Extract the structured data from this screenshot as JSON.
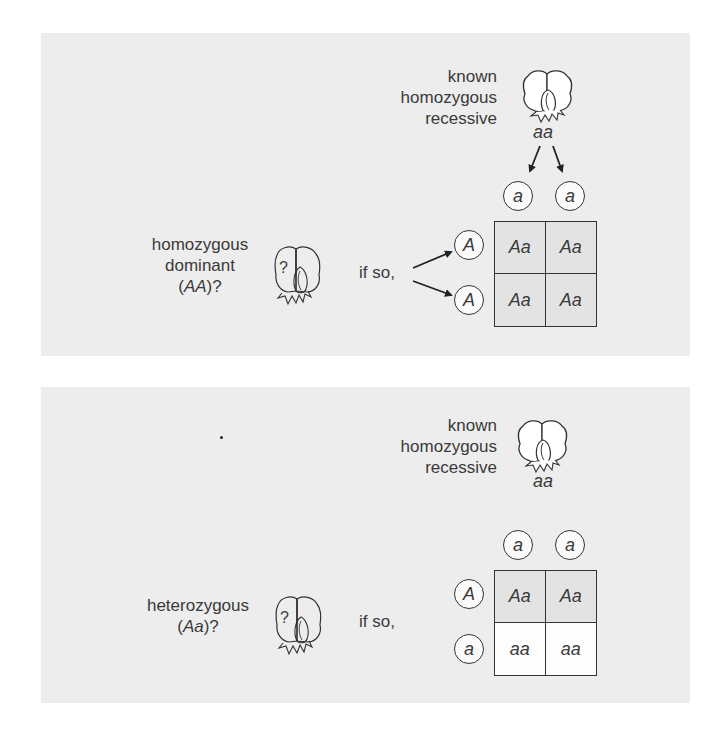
{
  "colors": {
    "page_background": "#ffffff",
    "panel_background": "#ededed",
    "shaded_cell": "#e3e3e3",
    "white_cell": "#fdfdfd",
    "line": "#333333"
  },
  "panels": [
    {
      "id": "homozygous-dominant-test",
      "known_parent": {
        "label_lines": [
          "known",
          "homozygous",
          "recessive"
        ],
        "genotype": "aa",
        "flower_icon": "white-pea-flower-icon",
        "gametes": [
          "a",
          "a"
        ]
      },
      "unknown_parent": {
        "label_lines": [
          "homozygous",
          "dominant"
        ],
        "genotype_prefix": "(",
        "genotype": "AA",
        "genotype_suffix": ")?",
        "flower_icon": "question-pea-flower-icon",
        "flower_mark": "?"
      },
      "if_so": "if so,",
      "gametes": [
        "A",
        "A"
      ],
      "punnett": {
        "rows": [
          [
            "Aa",
            "Aa"
          ],
          [
            "Aa",
            "Aa"
          ]
        ],
        "row_shading": [
          "shaded",
          "shaded"
        ]
      }
    },
    {
      "id": "heterozygous-test",
      "known_parent": {
        "label_lines": [
          "known",
          "homozygous",
          "recessive"
        ],
        "genotype": "aa",
        "flower_icon": "white-pea-flower-icon",
        "gametes": [
          "a",
          "a"
        ]
      },
      "unknown_parent": {
        "label_lines": [
          "heterozygous"
        ],
        "genotype_prefix": "(",
        "genotype": "Aa",
        "genotype_suffix": ")?",
        "flower_icon": "question-pea-flower-icon",
        "flower_mark": "?"
      },
      "if_so": "if so,",
      "gametes": [
        "A",
        "a"
      ],
      "punnett": {
        "rows": [
          [
            "Aa",
            "Aa"
          ],
          [
            "aa",
            "aa"
          ]
        ],
        "row_shading": [
          "shaded",
          "white"
        ]
      }
    }
  ]
}
